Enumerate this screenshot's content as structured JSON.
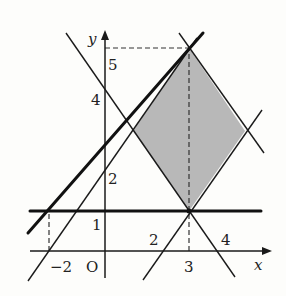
{
  "diagram": {
    "type": "coordinate-plane-linear-inequalities",
    "axes": {
      "x_label": "x",
      "y_label": "y",
      "origin_label": "O"
    },
    "tick_labels": {
      "x_neg2": "−2",
      "x_2": "2",
      "x_3": "3",
      "x_4": "4",
      "y_1": "1",
      "y_2": "2",
      "y_4": "4",
      "y_5": "5"
    },
    "shaded_region": {
      "shape": "rhombus",
      "vertices": [
        [
          3,
          1
        ],
        [
          5,
          3
        ],
        [
          3,
          5
        ],
        [
          1,
          3
        ]
      ],
      "fill": "#b8b8b8"
    },
    "lines": [
      {
        "equation": "y = x + 2",
        "style": "thin"
      },
      {
        "equation": "y = -x + 8",
        "style": "thin"
      },
      {
        "equation": "y = x - 2",
        "style": "thin"
      },
      {
        "equation": "y = -x + 4",
        "style": "thin"
      },
      {
        "equation": "y = 1",
        "style": "bold"
      },
      {
        "equation": "y = (4/5)(x + 2) + 1",
        "style": "bold"
      }
    ],
    "dashed_guides": [
      {
        "from": [
          -2,
          0
        ],
        "to": [
          -2,
          1
        ]
      },
      {
        "from": [
          3,
          0
        ],
        "to": [
          3,
          5
        ]
      },
      {
        "from": [
          0,
          5
        ],
        "to": [
          3,
          5
        ]
      }
    ],
    "colors": {
      "line": "#1a1a1a",
      "shade": "#b8b8b8",
      "background": "#fdfdfb"
    }
  }
}
